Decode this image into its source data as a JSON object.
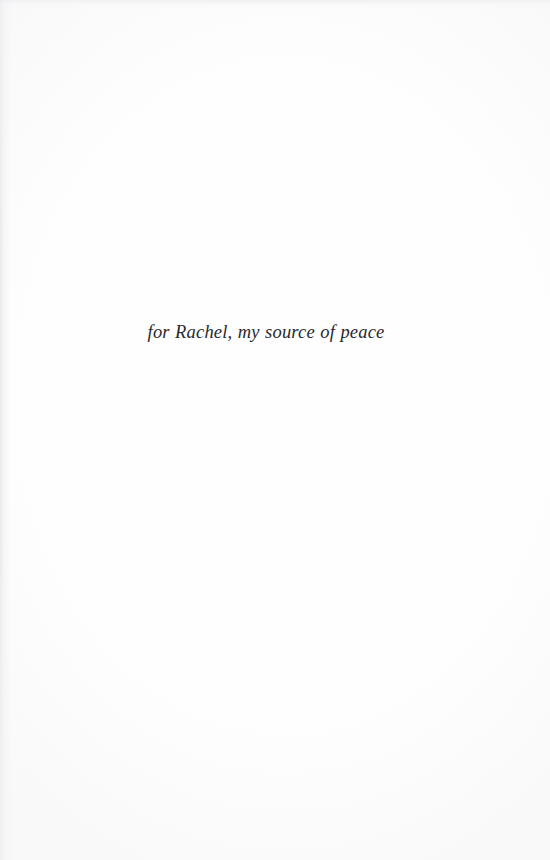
{
  "page": {
    "kind": "book-dedication-page",
    "width": 550,
    "height": 860,
    "background_color": "#fefefe",
    "ink_color": "#2a2a2e"
  },
  "dedication": {
    "text": "for Rachel, my source of peace"
  }
}
